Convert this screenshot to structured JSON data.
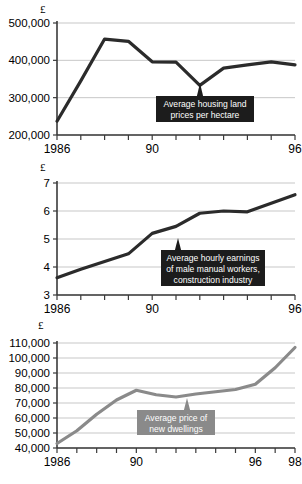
{
  "chart_data": [
    {
      "type": "line",
      "id": "housing-land-prices",
      "title": "",
      "ylabel": "£",
      "xlabel": "",
      "annotation": "Average housing land prices per hectare",
      "annotation_lines": [
        "Average housing land",
        "prices per hectare"
      ],
      "series_color": "#2b2b2b",
      "callout_color": "#1c1c1c",
      "ylim": [
        200000,
        500000
      ],
      "ytick_values": [
        200000,
        300000,
        400000,
        500000
      ],
      "ytick_labels": [
        "200,000",
        "300,000",
        "400,000",
        "500,000"
      ],
      "xlim": [
        1986,
        1996
      ],
      "xtick_values": [
        1986,
        1987,
        1988,
        1989,
        1990,
        1991,
        1992,
        1993,
        1994,
        1995,
        1996
      ],
      "xtick_labels": [
        "1986",
        "",
        "",
        "",
        "90",
        "",
        "",
        "",
        "",
        "",
        "96"
      ],
      "x": [
        1986,
        1987,
        1988,
        1989,
        1990,
        1991,
        1992,
        1993,
        1994,
        1995,
        1996
      ],
      "values": [
        237000,
        345000,
        457000,
        451000,
        396000,
        395000,
        333000,
        379000,
        388000,
        396000,
        388000
      ],
      "grid": true,
      "legend": "none"
    },
    {
      "type": "line",
      "id": "male-manual-hourly-earnings",
      "title": "",
      "ylabel": "£",
      "xlabel": "",
      "annotation": "Average hourly earnings of male manual workers, construction industry",
      "annotation_lines": [
        "Average hourly earnings",
        "of male manual workers,",
        "construction industry"
      ],
      "series_color": "#2b2b2b",
      "callout_color": "#1c1c1c",
      "ylim": [
        3,
        7
      ],
      "ytick_values": [
        3,
        4,
        5,
        6,
        7
      ],
      "ytick_labels": [
        "3",
        "4",
        "5",
        "6",
        "7"
      ],
      "xlim": [
        1986,
        1996
      ],
      "xtick_values": [
        1986,
        1987,
        1988,
        1989,
        1990,
        1991,
        1992,
        1993,
        1994,
        1995,
        1996
      ],
      "xtick_labels": [
        "1986",
        "",
        "",
        "",
        "90",
        "",
        "",
        "",
        "",
        "",
        "96"
      ],
      "x": [
        1986,
        1987,
        1988,
        1989,
        1990,
        1991,
        1992,
        1993,
        1994,
        1995,
        1996
      ],
      "values": [
        3.62,
        3.92,
        4.2,
        4.47,
        5.2,
        5.45,
        5.92,
        6.0,
        5.97,
        6.28,
        6.58
      ],
      "grid": true,
      "legend": "none"
    },
    {
      "type": "line",
      "id": "average-price-new-dwellings",
      "title": "",
      "ylabel": "£",
      "xlabel": "",
      "annotation": "Average price of new dwellings",
      "annotation_lines": [
        "Average price of",
        "new dwellings"
      ],
      "series_color": "#8a8a8a",
      "callout_color": "#8a8a8a",
      "ylim": [
        40000,
        110000
      ],
      "ytick_values": [
        40000,
        50000,
        60000,
        70000,
        80000,
        90000,
        100000,
        110000
      ],
      "ytick_labels": [
        "40,000",
        "50,000",
        "60,000",
        "70,000",
        "80,000",
        "90,000",
        "100,000",
        "110,000"
      ],
      "xlim": [
        1986,
        1998
      ],
      "xtick_values": [
        1986,
        1987,
        1988,
        1989,
        1990,
        1991,
        1992,
        1993,
        1994,
        1995,
        1996,
        1997,
        1998
      ],
      "xtick_labels": [
        "1986",
        "",
        "",
        "",
        "90",
        "",
        "",
        "",
        "",
        "",
        "96",
        "",
        "98"
      ],
      "x": [
        1986,
        1987,
        1988,
        1989,
        1990,
        1991,
        1992,
        1993,
        1994,
        1995,
        1996,
        1997,
        1998
      ],
      "values": [
        43000,
        51500,
        62500,
        72000,
        78500,
        75500,
        74000,
        76000,
        77500,
        79000,
        82500,
        93500,
        107000
      ],
      "grid": true,
      "legend": "none"
    }
  ]
}
